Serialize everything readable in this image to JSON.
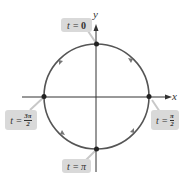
{
  "diagram": {
    "type": "unit circle parametrization",
    "axes": {
      "x_label": "x",
      "y_label": "y"
    },
    "direction": "clockwise",
    "points": [
      {
        "position": "top",
        "label_prefix": "t = ",
        "value": "0"
      },
      {
        "position": "right",
        "label_prefix": "t = ",
        "numerator": "π",
        "denominator": "2"
      },
      {
        "position": "bottom",
        "label_prefix": "t = ",
        "value": "π"
      },
      {
        "position": "left",
        "label_prefix": "t = ",
        "numerator": "3π",
        "denominator": "2"
      }
    ],
    "colors": {
      "circle": "#555555",
      "axes": "#333333",
      "label_bg": "#d9d9d9",
      "leader": "#c8c8c8"
    }
  }
}
